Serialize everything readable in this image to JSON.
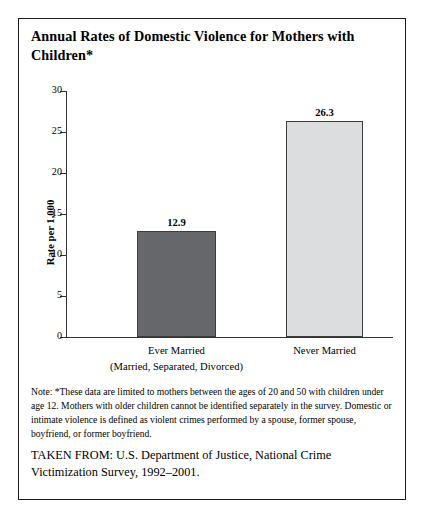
{
  "figure": {
    "title": "Annual Rates of Domestic Violence for Mothers with Children*",
    "note": "Note: *These data are limited to mothers between the ages of 20 and 50 with children under age 12. Mothers with older children cannot be identified separately in the survey. Domestic or intimate violence is defined as violent crimes performed by a spouse, former spouse, boyfriend, or former boyfriend.",
    "source": "TAKEN FROM: U.S. Department of Justice, National Crime Victimization Survey, 1992–2001."
  },
  "chart_data": {
    "type": "bar",
    "title": "Annual Rates of Domestic Violence for Mothers with Children*",
    "xlabel": "",
    "ylabel": "Rate per 1,000",
    "categories": [
      "Ever Married",
      "Never Married"
    ],
    "category_sublabels": [
      "(Married, Separated, Divorced)",
      ""
    ],
    "values": [
      12.9,
      26.3
    ],
    "value_labels": [
      "12.9",
      "26.3"
    ],
    "ylim": [
      0,
      30
    ],
    "yticks": [
      0,
      5,
      10,
      15,
      20,
      25,
      30
    ],
    "ytick_labels": [
      "0",
      "5",
      "10",
      "15",
      "20",
      "25",
      "30"
    ],
    "grid": false,
    "legend": "none",
    "bar_colors": [
      "#66676a",
      "#dcdddf"
    ],
    "bar_border_color": "#3c3c3c"
  },
  "colors": {
    "frame_border": "#1a1a1a",
    "axis": "#333333",
    "text": "#000000",
    "background": "#ffffff"
  }
}
